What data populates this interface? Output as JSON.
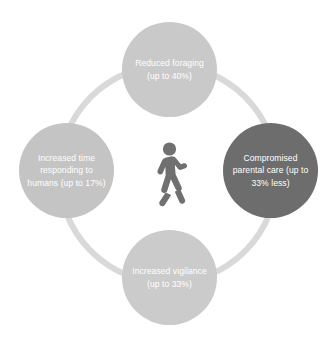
{
  "diagram": {
    "type": "cycle-diagram",
    "center": {
      "icon": "walking-person-icon",
      "color": "#707070"
    },
    "ring": {
      "color": "#d9d9d9"
    },
    "nodes": [
      {
        "position": "top",
        "label": "Reduced foraging (up to 40%)",
        "color": "#c9c9c9",
        "text_color": "#ffffff"
      },
      {
        "position": "right",
        "label": "Compromised parental care (up to 33% less)",
        "color": "#6d6d6d",
        "text_color": "#ffffff"
      },
      {
        "position": "bottom",
        "label": "Increased vigilance (up to 33%)",
        "color": "#cbcbcb",
        "text_color": "#ffffff"
      },
      {
        "position": "left",
        "label": "Increased time responding to humans (up to 17%)",
        "color": "#c4c4c4",
        "text_color": "#ffffff"
      }
    ]
  }
}
